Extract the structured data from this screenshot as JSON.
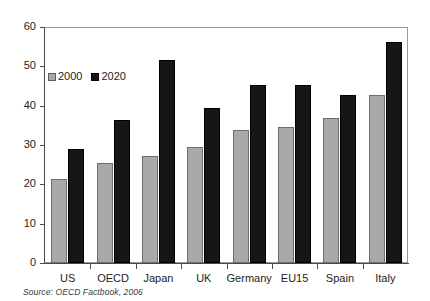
{
  "chart_data": {
    "type": "bar",
    "title": "",
    "subtitle": "",
    "xlabel": "",
    "ylabel": "",
    "categories": [
      "US",
      "OECD",
      "Japan",
      "UK",
      "Germany",
      "EU15",
      "Spain",
      "Italy"
    ],
    "series": [
      {
        "name": "2000",
        "color": "#a9a9a9",
        "values": [
          21.3,
          25.3,
          27.3,
          29.5,
          33.8,
          34.6,
          36.8,
          42.8
        ]
      },
      {
        "name": "2020",
        "color": "#161616",
        "values": [
          29.0,
          36.3,
          51.7,
          39.5,
          45.3,
          45.3,
          42.6,
          56.3
        ]
      }
    ],
    "ylim": [
      0,
      60
    ],
    "yticks": [
      0,
      10,
      20,
      30,
      40,
      50,
      60
    ],
    "ytick_labels": [
      "0",
      "10",
      "20",
      "30",
      "40",
      "50",
      "60"
    ],
    "grid": false,
    "legend_position": "inside-top-left",
    "legend_entries": [
      "2000",
      "2020"
    ]
  },
  "source_note": "Source: OECD Factbook, 2006",
  "colors": {
    "series_2000": "#a9a9a9",
    "series_2020": "#161616",
    "axis": "#4a4a4a",
    "frame": "#9a9a9a",
    "text": "#1d1d1d"
  }
}
